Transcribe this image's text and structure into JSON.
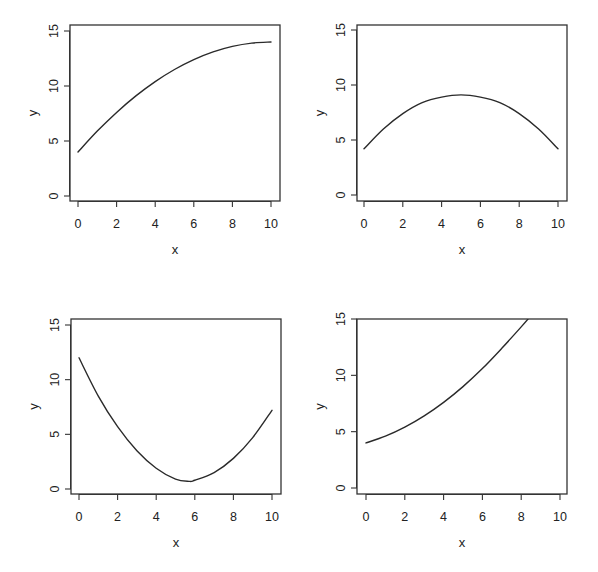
{
  "figure": {
    "layout": "2x2 grid of line plots",
    "line_color": "#2a2a2a",
    "frame_color": "#333333"
  },
  "chart_data": [
    {
      "type": "line",
      "panel": "top-left",
      "title": "",
      "xlabel": "x",
      "ylabel": "y",
      "xlim": [
        0,
        10
      ],
      "ylim": [
        0,
        15
      ],
      "xticks": [
        0,
        2,
        4,
        6,
        8,
        10
      ],
      "yticks": [
        0,
        5,
        10,
        15
      ],
      "grid": false,
      "legend": null,
      "shape": "concave increasing, plateauing near x=10",
      "x": [
        0,
        1,
        2,
        3,
        4,
        5,
        6,
        7,
        8,
        9,
        10
      ],
      "y": [
        4.0,
        5.9,
        7.6,
        9.1,
        10.4,
        11.5,
        12.4,
        13.1,
        13.6,
        13.9,
        14.0
      ]
    },
    {
      "type": "line",
      "panel": "top-right",
      "title": "",
      "xlabel": "x",
      "ylabel": "y",
      "xlim": [
        0,
        10
      ],
      "ylim": [
        0,
        15
      ],
      "xticks": [
        0,
        2,
        4,
        6,
        8,
        10
      ],
      "yticks": [
        0,
        5,
        10,
        15
      ],
      "grid": false,
      "legend": null,
      "shape": "symmetric concave parabola, max at x=5",
      "x": [
        0,
        1,
        2,
        3,
        4,
        5,
        6,
        7,
        8,
        9,
        10
      ],
      "y": [
        4.2,
        6.0,
        7.4,
        8.4,
        8.9,
        9.1,
        8.9,
        8.4,
        7.4,
        6.0,
        4.2
      ]
    },
    {
      "type": "line",
      "panel": "bottom-left",
      "title": "",
      "xlabel": "x",
      "ylabel": "y",
      "xlim": [
        0,
        10
      ],
      "ylim": [
        0,
        15
      ],
      "xticks": [
        0,
        2,
        4,
        6,
        8,
        10
      ],
      "yticks": [
        0,
        5,
        10,
        15
      ],
      "grid": false,
      "legend": null,
      "shape": "convex parabola, min near x=5.7",
      "x": [
        0,
        1,
        2,
        3,
        4,
        5,
        5.7,
        6,
        7,
        8,
        9,
        10
      ],
      "y": [
        12.0,
        8.5,
        5.7,
        3.5,
        1.9,
        0.9,
        0.7,
        0.8,
        1.5,
        2.8,
        4.7,
        7.2
      ]
    },
    {
      "type": "line",
      "panel": "bottom-right",
      "title": "",
      "xlabel": "x",
      "ylabel": "y",
      "xlim": [
        0,
        10
      ],
      "ylim": [
        0,
        15
      ],
      "xticks": [
        0,
        2,
        4,
        6,
        8,
        10
      ],
      "yticks": [
        0,
        5,
        10,
        15
      ],
      "grid": false,
      "legend": null,
      "shape": "convex increasing, exits top of plot near x=8.5",
      "x": [
        0,
        1,
        2,
        3,
        4,
        5,
        6,
        7,
        8,
        8.5
      ],
      "y": [
        4.0,
        4.6,
        5.4,
        6.4,
        7.6,
        9.0,
        10.6,
        12.4,
        14.3,
        15.3
      ]
    }
  ],
  "panel_geometry": [
    {
      "left": 70,
      "right": 280,
      "top": 25,
      "bottom": 201,
      "x0_px": 78,
      "x10_px": 271,
      "y0_px": 196,
      "y15_px": 31
    },
    {
      "left": 357,
      "right": 567,
      "top": 25,
      "bottom": 201,
      "x0_px": 364,
      "x10_px": 558,
      "y0_px": 195,
      "y15_px": 30
    },
    {
      "left": 71,
      "right": 281,
      "top": 319,
      "bottom": 494,
      "x0_px": 79,
      "x10_px": 272,
      "y0_px": 489,
      "y15_px": 325
    },
    {
      "left": 357,
      "right": 567,
      "top": 319,
      "bottom": 494,
      "x0_px": 366,
      "x10_px": 560,
      "y0_px": 488,
      "y15_px": 319
    }
  ]
}
